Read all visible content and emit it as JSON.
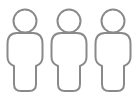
{
  "icons": [
    {
      "name": "person-icon",
      "left": 0
    },
    {
      "name": "person-icon",
      "left": 44
    },
    {
      "name": "person-icon",
      "left": 88
    }
  ],
  "colors": {
    "stroke": "#8a8a8a",
    "background": "#ffffff"
  }
}
